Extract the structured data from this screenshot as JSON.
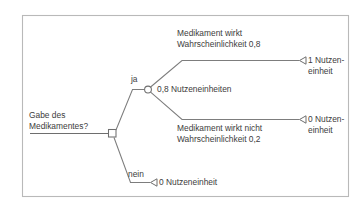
{
  "figure": {
    "type": "decision-tree",
    "language": "de",
    "frame_color": "#b9b9b9",
    "line_color": "#7d7d7d",
    "text_color": "#3c3c3c",
    "background": "#ffffff"
  },
  "root": {
    "label_line1": "Gabe des",
    "label_line2": "Medikamentes?",
    "node_type": "decision-square"
  },
  "branches": {
    "yes_label": "ja",
    "no_label": "nein"
  },
  "chance_node": {
    "expected_value": "0,8 Nutzeneinheiten",
    "node_type": "chance-circle"
  },
  "outcomes": {
    "effective": {
      "description": "Medikament wirkt",
      "probability": "Wahrscheinlichkeit 0,8",
      "payoff_line1": "1 Nutzen-",
      "payoff_line2": "einheit"
    },
    "not_effective": {
      "description": "Medikament wirkt nicht",
      "probability": "Wahrscheinlichkeit 0,2",
      "payoff_line1": "0 Nutzen-",
      "payoff_line2": "einheit"
    },
    "no_treatment": {
      "payoff": "0 Nutzeneinheit"
    }
  }
}
